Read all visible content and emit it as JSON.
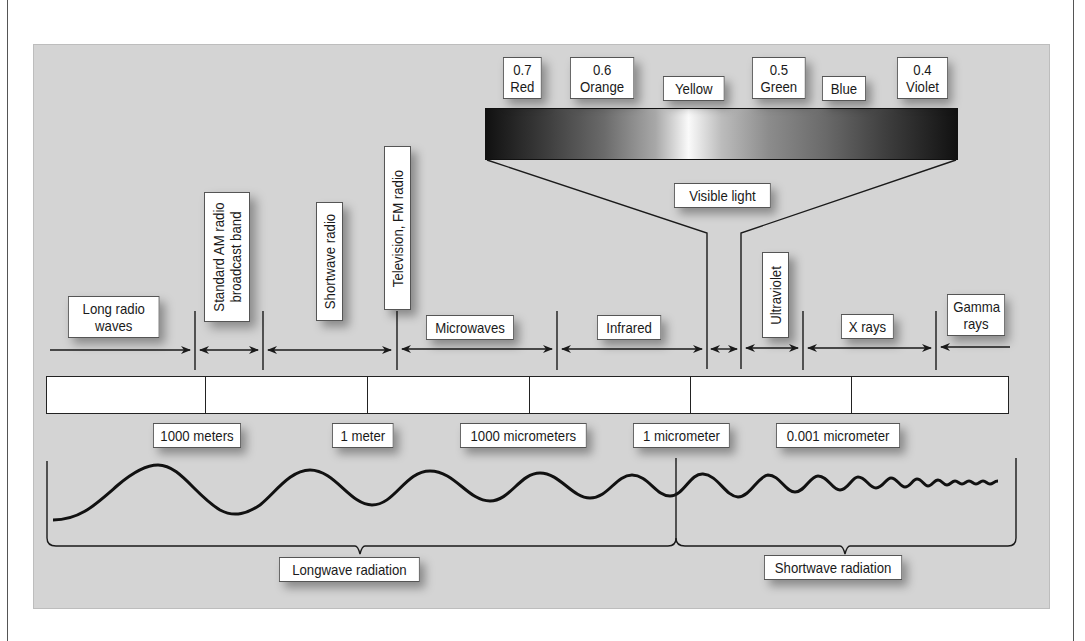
{
  "diagram": {
    "bands": [
      {
        "label": "Long radio waves",
        "orientation": "horizontal"
      },
      {
        "label": "Standard AM radio broadcast band",
        "orientation": "vertical"
      },
      {
        "label": "Shortwave radio",
        "orientation": "vertical"
      },
      {
        "label": "Television, FM radio",
        "orientation": "vertical"
      },
      {
        "label": "Microwaves",
        "orientation": "horizontal"
      },
      {
        "label": "Infrared",
        "orientation": "horizontal"
      },
      {
        "label": "Visible light",
        "orientation": "horizontal"
      },
      {
        "label": "Ultraviolet",
        "orientation": "vertical"
      },
      {
        "label": "X rays",
        "orientation": "horizontal"
      },
      {
        "label": "Gamma rays",
        "orientation": "horizontal"
      }
    ],
    "labels": {
      "long_radio_line1": "Long radio",
      "long_radio_line2": "waves",
      "am_line1": "Standard AM radio",
      "am_line2": "broadcast band",
      "shortwave_radio": "Shortwave radio",
      "tv_fm": "Television, FM radio",
      "microwaves": "Microwaves",
      "infrared": "Infrared",
      "visible_light": "Visible light",
      "ultraviolet": "Ultraviolet",
      "xrays": "X rays",
      "gamma_line1": "Gamma",
      "gamma_line2": "rays"
    },
    "visible_colors": [
      {
        "wavelength": "0.7",
        "color": "Red"
      },
      {
        "wavelength": "0.6",
        "color": "Orange"
      },
      {
        "wavelength": "",
        "color": "Yellow"
      },
      {
        "wavelength": "0.5",
        "color": "Green"
      },
      {
        "wavelength": "",
        "color": "Blue"
      },
      {
        "wavelength": "0.4",
        "color": "Violet"
      }
    ],
    "wavelength_scale": [
      "1000 meters",
      "1 meter",
      "1000 micrometers",
      "1 micrometer",
      "0.001 micrometer"
    ],
    "radiation_groups": [
      {
        "label": "Longwave radiation"
      },
      {
        "label": "Shortwave radiation"
      }
    ],
    "colors": {
      "panel_bg": "#d4d4d4",
      "label_bg": "#ffffff",
      "line": "#1a1a1a"
    }
  }
}
